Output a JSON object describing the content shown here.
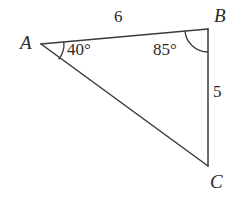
{
  "figure": {
    "kind": "triangle-diagram",
    "background_color": "#ffffff",
    "stroke_color": "#3a3a3a"
  },
  "vertices": {
    "a": {
      "label": "A",
      "x": 41,
      "y": 44
    },
    "b": {
      "label": "B",
      "x": 208,
      "y": 29
    },
    "c": {
      "label": "C",
      "x": 208,
      "y": 166
    }
  },
  "sides": {
    "ab": {
      "label": "6",
      "from": "A",
      "to": "B"
    },
    "bc": {
      "label": "5",
      "from": "B",
      "to": "C"
    },
    "ac": {
      "label": "",
      "from": "A",
      "to": "C"
    }
  },
  "angles": {
    "at_a": {
      "label": "40°",
      "value": 40,
      "unit": "degrees"
    },
    "at_b": {
      "label": "85°",
      "value": 85,
      "unit": "degrees"
    }
  }
}
